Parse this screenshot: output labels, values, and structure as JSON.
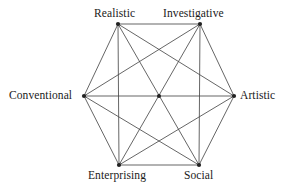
{
  "diagram": {
    "type": "hexagon-complete-graph",
    "background_color": "#ffffff",
    "line_color": "#4a4a4a",
    "node_color": "#222222",
    "text_color": "#1a1a1a",
    "vertices": [
      {
        "id": "realistic",
        "label": "Realistic",
        "x": 118,
        "y": 24,
        "label_anchor": "bottom"
      },
      {
        "id": "investigative",
        "label": "Investigative",
        "x": 200,
        "y": 24,
        "label_anchor": "bottom"
      },
      {
        "id": "artistic",
        "label": "Artistic",
        "x": 234,
        "y": 96,
        "label_anchor": "right"
      },
      {
        "id": "social",
        "label": "Social",
        "x": 199,
        "y": 165,
        "label_anchor": "top"
      },
      {
        "id": "enterprising",
        "label": "Enterprising",
        "x": 119,
        "y": 165,
        "label_anchor": "top"
      },
      {
        "id": "conventional",
        "label": "Conventional",
        "x": 84,
        "y": 96,
        "label_anchor": "left"
      }
    ],
    "center_node": {
      "x": 159,
      "y": 96
    },
    "edges": [
      [
        "realistic",
        "investigative"
      ],
      [
        "realistic",
        "artistic"
      ],
      [
        "realistic",
        "social"
      ],
      [
        "realistic",
        "enterprising"
      ],
      [
        "realistic",
        "conventional"
      ],
      [
        "investigative",
        "artistic"
      ],
      [
        "investigative",
        "social"
      ],
      [
        "investigative",
        "enterprising"
      ],
      [
        "investigative",
        "conventional"
      ],
      [
        "artistic",
        "social"
      ],
      [
        "artistic",
        "enterprising"
      ],
      [
        "artistic",
        "conventional"
      ],
      [
        "social",
        "enterprising"
      ],
      [
        "social",
        "conventional"
      ],
      [
        "enterprising",
        "conventional"
      ]
    ]
  }
}
